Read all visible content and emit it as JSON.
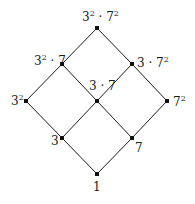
{
  "diagram": {
    "type": "hasse-diagram",
    "colors": {
      "line": "#1a1a1a",
      "node": "#111111",
      "background": "#ffffff"
    },
    "nodes": [
      {
        "id": "n1",
        "base": "1",
        "label": "1",
        "x": 97,
        "y": 174
      },
      {
        "id": "n3",
        "base": "3",
        "label": "3",
        "x": 62,
        "y": 138
      },
      {
        "id": "n7",
        "base": "7",
        "label": "7",
        "x": 132,
        "y": 138
      },
      {
        "id": "n9",
        "base": "3",
        "sup": "2",
        "label": "3^2",
        "x": 26,
        "y": 101
      },
      {
        "id": "n21",
        "label": "3 · 7",
        "x": 97,
        "y": 101
      },
      {
        "id": "n49",
        "base": "7",
        "sup": "2",
        "label": "7^2",
        "x": 167,
        "y": 101
      },
      {
        "id": "n63",
        "label": "3^2 · 7",
        "x": 62,
        "y": 64
      },
      {
        "id": "n147",
        "label": "3 · 7^2",
        "x": 132,
        "y": 64
      },
      {
        "id": "n441",
        "label": "3^2 · 7^2",
        "x": 97,
        "y": 28
      }
    ],
    "edges": [
      [
        "n1",
        "n3"
      ],
      [
        "n1",
        "n7"
      ],
      [
        "n3",
        "n9"
      ],
      [
        "n3",
        "n21"
      ],
      [
        "n7",
        "n21"
      ],
      [
        "n7",
        "n49"
      ],
      [
        "n9",
        "n63"
      ],
      [
        "n21",
        "n63"
      ],
      [
        "n21",
        "n147"
      ],
      [
        "n49",
        "n147"
      ],
      [
        "n63",
        "n441"
      ],
      [
        "n147",
        "n441"
      ]
    ],
    "labels": {
      "one": "1",
      "three": "3",
      "seven": "7",
      "three_sq_base": "3",
      "three_sq_exp": "2",
      "seven_sq_base": "7",
      "seven_sq_exp": "2",
      "three_seven": "3 · 7",
      "n63_a": "3",
      "n63_exp": "2",
      "n63_b": " · 7",
      "n147_a": "3 · 7",
      "n147_exp": "2",
      "top_a": "3",
      "top_exp1": "2",
      "top_b": " · 7",
      "top_exp2": "2"
    }
  }
}
